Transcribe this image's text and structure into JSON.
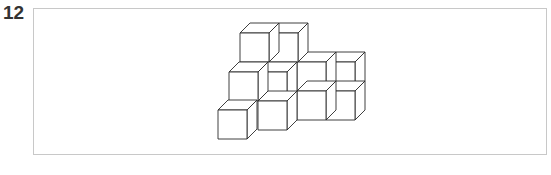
{
  "question": {
    "number": "12",
    "figure": {
      "description": "Isometric arrangement of unit cubes",
      "cube_count": 10,
      "line_color": "#2a2a2a",
      "frame_color": "#c8c8c8"
    }
  }
}
